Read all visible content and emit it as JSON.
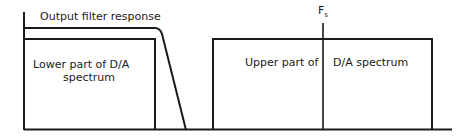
{
  "diagram": {
    "title_label": "Output filter response",
    "lower_block": {
      "line1": "Lower part of D/A",
      "line2": "spectrum"
    },
    "upper_block": {
      "left_text": "Upper part of",
      "right_text": "D/A spectrum"
    },
    "marker": {
      "label": "F",
      "subscript": "s"
    },
    "colors": {
      "line": "#1a1a1a",
      "background": "#ffffff"
    }
  }
}
